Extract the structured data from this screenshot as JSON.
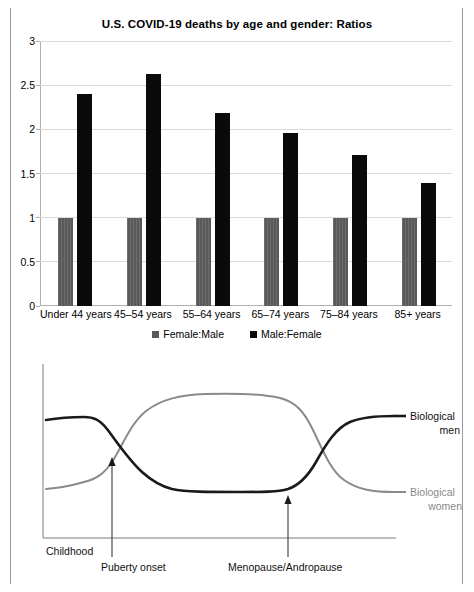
{
  "page": {
    "background": "#ffffff",
    "frame_color": "#9a9a9a"
  },
  "bar_chart": {
    "title": "U.S. COVID-19 deaths by age and gender: Ratios",
    "legend": [
      {
        "label": "Female:Male",
        "color": "#595959"
      },
      {
        "label": "Male:Female",
        "color": "#0a0a0a"
      }
    ],
    "y_ticks": [
      "0",
      "0.5",
      "1",
      "1.5",
      "2",
      "2.5",
      "3"
    ],
    "x_labels": [
      "Under 44 years",
      "45–54 years",
      "55–64 years",
      "65–74 years",
      "75–84 years",
      "85+ years"
    ]
  },
  "line_chart": {
    "y_axis_label": "Asthma severity",
    "series_labels": [
      {
        "line1": "Biological",
        "line2": "men",
        "color": "#1a1a1a"
      },
      {
        "line1": "Biological",
        "line2": "women",
        "color": "#8a8a8a"
      }
    ],
    "annotations": [
      {
        "label": "Childhood",
        "has_arrow": false
      },
      {
        "label": "Puberty onset",
        "has_arrow": true
      },
      {
        "label": "Menopause/Andropause",
        "has_arrow": true
      }
    ]
  },
  "chart_data": [
    {
      "type": "bar",
      "title": "U.S. COVID-19 deaths by age and gender: Ratios",
      "xlabel": "",
      "ylabel": "",
      "ylim": [
        0,
        3
      ],
      "yticks": [
        0,
        0.5,
        1,
        1.5,
        2,
        2.5,
        3
      ],
      "grid": true,
      "legend_position": "bottom",
      "categories": [
        "Under 44 years",
        "45–54 years",
        "55–64 years",
        "65–74 years",
        "75–84 years",
        "85+ years"
      ],
      "series": [
        {
          "name": "Female:Male",
          "color": "#595959",
          "values": [
            1.0,
            1.0,
            1.0,
            1.0,
            1.0,
            1.0
          ]
        },
        {
          "name": "Male:Female",
          "color": "#0a0a0a",
          "values": [
            2.4,
            2.63,
            2.19,
            1.96,
            1.71,
            1.39
          ]
        }
      ]
    },
    {
      "type": "line",
      "title": "",
      "xlabel": "",
      "ylabel": "Asthma severity",
      "grid": false,
      "legend_position": "right-inline",
      "x_annotations": [
        "Childhood",
        "Puberty onset",
        "Menopause/Andropause"
      ],
      "x": [
        0,
        10,
        20,
        25,
        30,
        35,
        42,
        50,
        60,
        68,
        72,
        78,
        85,
        92,
        100
      ],
      "series": [
        {
          "name": "Biological men",
          "color": "#1a1a1a",
          "values": [
            0.62,
            0.64,
            0.63,
            0.52,
            0.38,
            0.26,
            0.18,
            0.18,
            0.18,
            0.18,
            0.25,
            0.45,
            0.6,
            0.65,
            0.66
          ]
        },
        {
          "name": "Biological women",
          "color": "#8a8a8a",
          "values": [
            0.26,
            0.28,
            0.33,
            0.48,
            0.68,
            0.82,
            0.9,
            0.92,
            0.92,
            0.9,
            0.82,
            0.58,
            0.36,
            0.3,
            0.29
          ]
        }
      ]
    }
  ]
}
